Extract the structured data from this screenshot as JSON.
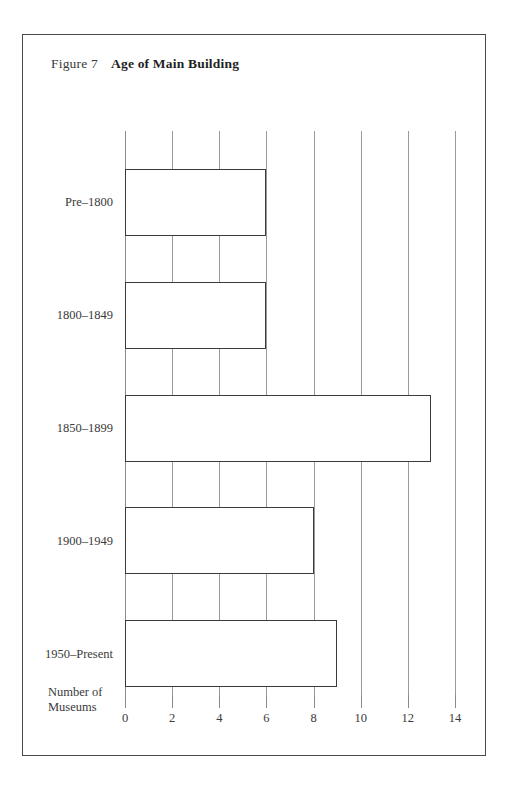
{
  "figure": {
    "number": "Figure 7",
    "title": "Age of Main Building"
  },
  "chart_data": {
    "type": "bar",
    "orientation": "horizontal",
    "title": "Age of Main Building",
    "subtitle": "Figure 7",
    "xlabel": "Number of Museums",
    "ylabel": "",
    "categories": [
      "Pre–1800",
      "1800–1849",
      "1850–1899",
      "1900–1949",
      "1950–Present"
    ],
    "values": [
      6,
      6,
      13,
      8,
      9
    ],
    "xlim": [
      0,
      14
    ],
    "xticks": [
      0,
      2,
      4,
      6,
      8,
      10,
      12,
      14
    ],
    "xticklabels": [
      "0",
      "2",
      "4",
      "6",
      "8",
      "10",
      "12",
      "14"
    ],
    "grid": "vertical",
    "legend": "none",
    "bar_fill": "dotted-stipple",
    "bar_edge_color": "#3a3a3a",
    "gridline_color": "#9a9a9a",
    "frame_color": "#4a4a4a",
    "text_color": "#3a3a3a"
  },
  "x_axis_title_lines": [
    "Number of",
    "Museums"
  ]
}
